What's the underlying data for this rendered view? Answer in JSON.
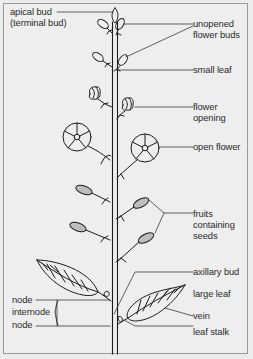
{
  "diagram": {
    "colors": {
      "background": "#ececec",
      "line": "#1c1c1c",
      "fruit_fill": "#bdbdbd",
      "text": "#2a2a2a",
      "frame_border": "#9a9a9a"
    },
    "labels": {
      "apical_bud_line1": "apical bud",
      "apical_bud_line2": "(terminal bud)",
      "unopened_buds_line1": "unopened",
      "unopened_buds_line2": "flower buds",
      "small_leaf": "small leaf",
      "flower_opening_line1": "flower",
      "flower_opening_line2": "opening",
      "open_flower": "open flower",
      "fruits_line1": "fruits",
      "fruits_line2": "containing",
      "fruits_line3": "seeds",
      "axillary_bud": "axillary bud",
      "large_leaf": "large leaf",
      "vein": "vein",
      "leaf_stalk": "leaf stalk",
      "node_upper": "node",
      "internode": "internode",
      "node_lower": "node"
    }
  }
}
